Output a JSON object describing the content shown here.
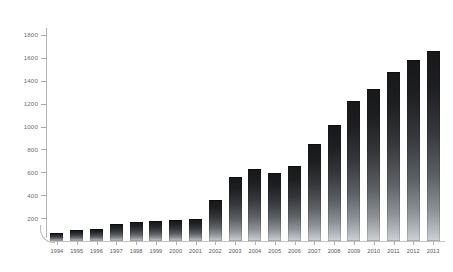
{
  "chart_data": {
    "type": "bar",
    "title": "",
    "subtitle": "",
    "xlabel": "",
    "ylabel": "",
    "categories": [
      "1994",
      "1995",
      "1996",
      "1997",
      "1998",
      "1999",
      "2000",
      "2001",
      "2002",
      "2003",
      "2004",
      "2005",
      "2006",
      "2007",
      "2008",
      "2009",
      "2010",
      "2011",
      "2012",
      "2013"
    ],
    "values": [
      71,
      94,
      105,
      148,
      168,
      171,
      185,
      196,
      356,
      561,
      627,
      590,
      658,
      846,
      1009,
      1225,
      1331,
      1473,
      1580,
      1658
    ],
    "series": [
      {
        "name": "",
        "values": [
          71,
          94,
          105,
          148,
          168,
          171,
          185,
          196,
          356,
          561,
          627,
          590,
          658,
          846,
          1009,
          1225,
          1331,
          1473,
          1580,
          1658
        ]
      }
    ],
    "ylim": [
      0,
      1860
    ],
    "yticks": [
      200,
      400,
      600,
      800,
      1000,
      1200,
      1400,
      1600,
      1800
    ],
    "ytick_labels": [
      "200",
      "400",
      "600",
      "800",
      "1000",
      "1200",
      "1400",
      "1600",
      "1800"
    ],
    "xtick_labels": [
      "1994",
      "1995",
      "1996",
      "1997",
      "1998",
      "1999",
      "2000",
      "2001",
      "2002",
      "2003",
      "2004",
      "2005",
      "2006",
      "2007",
      "2008",
      "2009",
      "2010",
      "2011",
      "2012",
      "2013"
    ],
    "grid": false,
    "legend": null,
    "legend_position": "none",
    "annotations": [],
    "bar_color_top": "#17181a",
    "bar_color_bottom": "#cfd2d6",
    "axis_color": "#b4b4b4",
    "tick_label_color": "#6d6d6d",
    "background_color": "#ffffff"
  }
}
